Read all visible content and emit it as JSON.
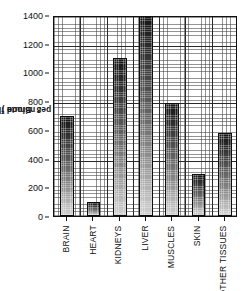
{
  "chart_data": {
    "type": "bar",
    "title": "",
    "subtitle": "",
    "xlabel": "",
    "ylabel": "Blood flow (cm³ per minute)",
    "ylabel_prefix": "Blood flow (cm",
    "ylabel_superscript": "3",
    "ylabel_suffix": " per minute )",
    "categories": [
      "BRAIN",
      "HEART",
      "KIDNEYS",
      "LIVER",
      "MUSCLES",
      "SKIN",
      "OTHER TISSUES"
    ],
    "values": [
      700,
      100,
      1100,
      1400,
      790,
      290,
      580
    ],
    "ylim": [
      0,
      1400
    ],
    "yticks": [
      0,
      200,
      400,
      600,
      800,
      1000,
      1200,
      1400
    ],
    "ytick_labels": [
      "0",
      "200",
      "400",
      "600",
      "800",
      "1000",
      "1200",
      "1400"
    ],
    "major_gridlines_y": [
      400,
      800,
      1200
    ],
    "grid": "fine dotted grid with darker major lines",
    "legend": "none",
    "legend_position": "none",
    "bar_fill": "vertical gradient, dark at top to light at bottom",
    "colors": {
      "axis": "#111111",
      "grid_fine": "#6b6b6b",
      "grid_major": "#2a2a2a",
      "bar_dark": "#161616",
      "bar_light": "#cfcfcf",
      "background": "#ffffff"
    }
  }
}
